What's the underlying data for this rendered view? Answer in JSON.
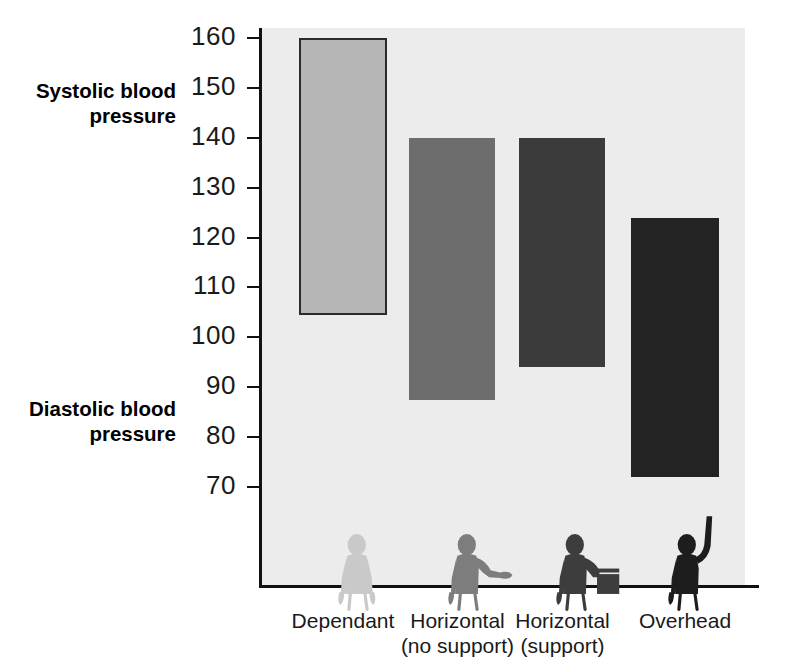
{
  "chart_data": {
    "type": "bar",
    "title": "",
    "subtitle": "",
    "xlabel": "",
    "ylabel": "",
    "ylim": [
      60,
      165
    ],
    "grid": false,
    "legend_position": "none",
    "annotations": [
      {
        "name": "systolic-annotation",
        "text_line1": "Systolic blood",
        "text_line2": "pressure",
        "value_ref": 150
      },
      {
        "name": "diastolic-annotation",
        "text_line1": "Diastolic blood",
        "text_line2": "pressure",
        "value_ref": 85
      }
    ],
    "ticks": [
      160,
      150,
      140,
      130,
      120,
      110,
      100,
      90,
      80,
      70
    ],
    "tick_labels": [
      "160",
      "150",
      "140",
      "130",
      "120",
      "110",
      "100",
      "90",
      "80",
      "70"
    ],
    "categories": [
      "Dependant",
      "Horizontal (no support)",
      "Horizontal (support)",
      "Overhead"
    ],
    "category_labels": [
      {
        "line1": "Dependant",
        "line2": ""
      },
      {
        "line1": "Horizontal",
        "line2": "(no support)"
      },
      {
        "line1": "Horizontal",
        "line2": "(support)"
      },
      {
        "line1": "Overhead",
        "line2": ""
      }
    ],
    "series": [
      {
        "name": "Systolic blood pressure",
        "values": [
          160,
          140,
          140,
          124
        ]
      },
      {
        "name": "Diastolic blood pressure",
        "values": [
          104.5,
          87.5,
          94,
          72
        ]
      }
    ],
    "bars": [
      {
        "category": "Dependant",
        "systolic": 160,
        "diastolic": 104.5,
        "fill": "#b6b6b6",
        "stroke": "#2b2b2b"
      },
      {
        "category": "Horizontal (no support)",
        "systolic": 140,
        "diastolic": 87.5,
        "fill": "#6d6d6d",
        "stroke": "none"
      },
      {
        "category": "Horizontal (support)",
        "systolic": 140,
        "diastolic": 94,
        "fill": "#3b3b3b",
        "stroke": "none"
      },
      {
        "category": "Overhead",
        "systolic": 124,
        "diastolic": 72,
        "fill": "#232323",
        "stroke": "none"
      }
    ],
    "figures": [
      {
        "name": "figure-dependant",
        "pose": "arms-hanging-down",
        "color": "#c9c9c9"
      },
      {
        "name": "figure-horizontal-no-support",
        "pose": "arm-outstretched-horizontal",
        "color": "#7d7d7d"
      },
      {
        "name": "figure-horizontal-support",
        "pose": "arm-resting-on-support",
        "color": "#3d3d3d"
      },
      {
        "name": "figure-overhead",
        "pose": "arm-raised-overhead",
        "color": "#1d1d1d"
      }
    ],
    "colors": {
      "panel_background": "#ececec",
      "page_background": "#ffffff",
      "axis": "#111111",
      "text": "#1a1a1a",
      "bar1": "#b6b6b6",
      "bar2": "#6d6d6d",
      "bar3": "#3b3b3b",
      "bar4": "#232323"
    }
  }
}
